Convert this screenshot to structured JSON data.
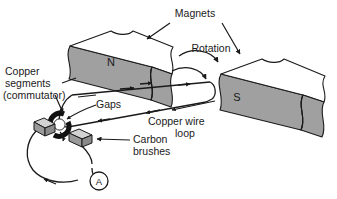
{
  "figure": {
    "background_color": "#ffffff",
    "ink_color": "#1a1a1a",
    "magnet_face_color": "#a0a0a0",
    "magnet_top_color": "#ffffff",
    "brush_color": "#9a9a9a",
    "commutator_color": "#111111"
  },
  "labels": {
    "magnets": "Magnets",
    "rotation": "Rotation",
    "copper_segments_line1": "Copper",
    "copper_segments_line2": "segments",
    "copper_segments_line3": "(commutator)",
    "gaps": "Gaps",
    "copper_wire_line1": "Copper wire",
    "copper_wire_line2": "loop",
    "carbon_brushes_line1": "Carbon",
    "carbon_brushes_line2": "brushes"
  },
  "poles": {
    "north": "N",
    "south": "S"
  },
  "meter": {
    "symbol": "A",
    "name": "ammeter"
  }
}
